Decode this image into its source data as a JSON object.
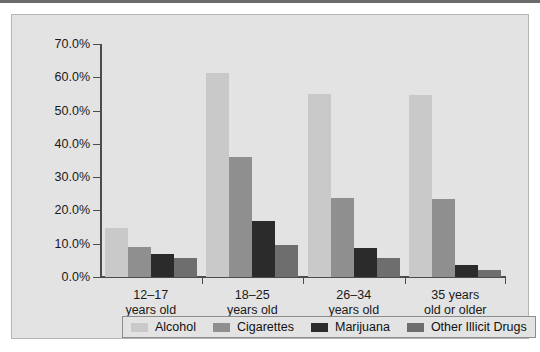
{
  "figure": {
    "background": "#e3e3e3",
    "frame_border": "#b5b5b5",
    "top_rule_color": "#6b6b6b"
  },
  "chart_data": {
    "type": "bar",
    "title": "",
    "subtitle": "",
    "xlabel": "",
    "ylabel": "",
    "grid": false,
    "legend_position": "bottom",
    "ylim": [
      0,
      70
    ],
    "yticks": [
      0,
      10,
      20,
      30,
      40,
      50,
      60,
      70
    ],
    "ytick_labels": [
      "0.0%",
      "10.0%",
      "20.0%",
      "30.0%",
      "40.0%",
      "50.0%",
      "60.0%",
      "70.0%"
    ],
    "categories": [
      "12–17 years old",
      "18–25 years old",
      "26–34 years old",
      "35 years old or older"
    ],
    "category_lines": [
      [
        "12–17",
        "years old"
      ],
      [
        "18–25",
        "years old"
      ],
      [
        "26–34",
        "years old"
      ],
      [
        "35 years",
        "old or older"
      ]
    ],
    "series": [
      {
        "name": "Alcohol",
        "color": "#c9c9c9",
        "values": [
          14.8,
          61.2,
          55.0,
          54.8
        ]
      },
      {
        "name": "Cigarettes",
        "color": "#8f8f8f",
        "values": [
          9.0,
          36.0,
          23.6,
          23.4
        ]
      },
      {
        "name": "Marijuana",
        "color": "#2b2b2b",
        "values": [
          6.9,
          16.8,
          8.6,
          3.5
        ]
      },
      {
        "name": "Other Illicit Drugs",
        "color": "#6e6e6e",
        "values": [
          5.7,
          9.5,
          5.6,
          2.1
        ]
      }
    ]
  }
}
